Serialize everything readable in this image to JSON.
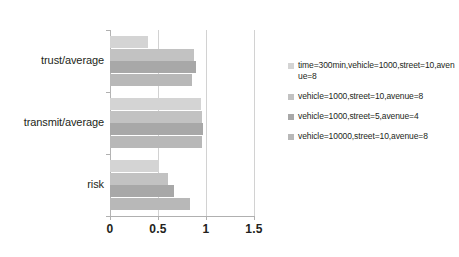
{
  "chart_data": {
    "type": "bar",
    "orientation": "horizontal",
    "title": "",
    "xlabel": "",
    "ylabel": "",
    "xlim": [
      0,
      1.5
    ],
    "xticks": [
      "0",
      "0.5",
      "1",
      "1.5"
    ],
    "xtick_values": [
      0,
      0.5,
      1,
      1.5
    ],
    "grid": true,
    "legend_position": "right",
    "categories": [
      "trust/average",
      "transmit/average",
      "risk"
    ],
    "series": [
      {
        "name": "time=300min,vehicle=1000,street=10,avenue=8",
        "color": "#d4d4d4",
        "values": [
          0.4,
          0.95,
          0.51
        ]
      },
      {
        "name": "vehicle=1000,street=10,avenue=8",
        "color": "#c2c2c2",
        "values": [
          0.88,
          0.96,
          0.6
        ]
      },
      {
        "name": "vehicle=1000,street=5,avenue=4",
        "color": "#a8a8a8",
        "values": [
          0.9,
          0.97,
          0.67
        ]
      },
      {
        "name": "vehicle=10000,street=10,avenue=8",
        "color": "#b8b8b8",
        "values": [
          0.85,
          0.96,
          0.83
        ]
      }
    ]
  },
  "axis": {
    "x_tick_labels": [
      "0",
      "0.5",
      "1",
      "1.5"
    ],
    "category_labels": [
      "trust/average",
      "transmit/average",
      "risk"
    ]
  },
  "legend": {
    "entries": [
      {
        "label": "time=300min,vehicle=1000,street=10,avenue=8"
      },
      {
        "label": "vehicle=1000,street=10,avenue=8"
      },
      {
        "label": "vehicle=1000,street=5,avenue=4"
      },
      {
        "label": "vehicle=10000,street=10,avenue=8"
      }
    ]
  }
}
